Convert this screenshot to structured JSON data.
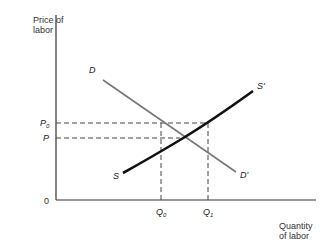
{
  "diagram": {
    "type": "supply-demand",
    "y_axis_label_line1": "Price of",
    "y_axis_label_line2": "labor",
    "x_axis_label_line1": "Quantity",
    "x_axis_label_line2": "of labor",
    "origin_label": "0",
    "price_labels": {
      "p0": "P",
      "p0_sub": "0",
      "p": "P"
    },
    "quantity_labels": {
      "q0": "Q",
      "q0_sub": "0",
      "q1": "Q",
      "q1_sub": "1"
    },
    "curve_labels": {
      "d": "D",
      "d_prime": "D'",
      "s": "S",
      "s_prime": "S'"
    },
    "colors": {
      "supply": "#111111",
      "demand": "#777777",
      "axis": "#333333",
      "dash": "#444444"
    }
  }
}
